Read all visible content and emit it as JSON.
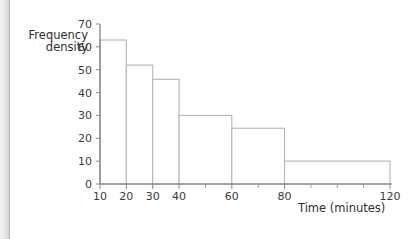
{
  "chart_data": {
    "type": "bar",
    "title": "",
    "xlabel": "Time (minutes)",
    "ylabel_line1": "Frequency",
    "ylabel_line2": "density",
    "xlim": [
      10,
      120
    ],
    "ylim": [
      0,
      70
    ],
    "grid": false,
    "legend": "none",
    "y_ticks": [
      0,
      10,
      20,
      30,
      40,
      50,
      60,
      70
    ],
    "y_tick_labels": [
      "0",
      "10",
      "20",
      "30",
      "40",
      "50",
      "60",
      "70"
    ],
    "x_ticks_major": [
      10,
      20,
      30,
      40,
      60,
      80,
      120
    ],
    "x_tick_labels": [
      "10",
      "20",
      "30",
      "40",
      "60",
      "80",
      "120"
    ],
    "x_ticks_minor": [
      50,
      70,
      90,
      100,
      110
    ],
    "bars": [
      {
        "x_start": 10,
        "x_end": 20,
        "value": 63,
        "label": "10-20"
      },
      {
        "x_start": 20,
        "x_end": 30,
        "value": 52,
        "label": "20-30"
      },
      {
        "x_start": 30,
        "x_end": 40,
        "value": 45.8,
        "label": "30-40"
      },
      {
        "x_start": 40,
        "x_end": 60,
        "value": 30,
        "label": "40-60"
      },
      {
        "x_start": 60,
        "x_end": 80,
        "value": 24.4,
        "label": "60-80"
      },
      {
        "x_start": 80,
        "x_end": 120,
        "value": 10,
        "label": "80-120"
      }
    ],
    "colors": {
      "bar_fill": "#ffffff",
      "bar_stroke": "#b5b5b5",
      "axis": "#6f6f6f",
      "text": "#2e2e2e",
      "background": "#ffffff"
    }
  }
}
